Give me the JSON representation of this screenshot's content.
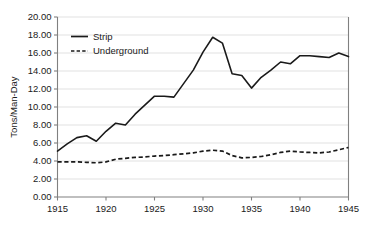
{
  "chart_data": {
    "type": "line",
    "title": "",
    "xlabel": "",
    "ylabel": "Tons/Man-Day",
    "xlim": [
      1915,
      1945
    ],
    "ylim": [
      0.0,
      20.0
    ],
    "grid": true,
    "legend_position": "top-left",
    "x": [
      1915,
      1916,
      1917,
      1918,
      1919,
      1920,
      1921,
      1922,
      1923,
      1924,
      1925,
      1926,
      1927,
      1928,
      1929,
      1930,
      1931,
      1932,
      1933,
      1934,
      1935,
      1936,
      1937,
      1938,
      1939,
      1940,
      1941,
      1942,
      1943,
      1944,
      1945
    ],
    "x_tick_labels": [
      "1915",
      "1920",
      "1925",
      "1930",
      "1935",
      "1940",
      "1945"
    ],
    "x_ticks": [
      1915,
      1920,
      1925,
      1930,
      1935,
      1940,
      1945
    ],
    "y_ticks": [
      0.0,
      2.0,
      4.0,
      6.0,
      8.0,
      10.0,
      12.0,
      14.0,
      16.0,
      18.0,
      20.0
    ],
    "y_tick_labels": [
      "0.00",
      "2.00",
      "4.00",
      "6.00",
      "8.00",
      "10.00",
      "12.00",
      "14.00",
      "16.00",
      "18.00",
      "20.00"
    ],
    "series": [
      {
        "name": "Strip",
        "style": "solid",
        "color": "#1a1a1a",
        "values": [
          5.1,
          5.9,
          6.6,
          6.8,
          6.2,
          7.3,
          8.2,
          8.0,
          9.2,
          10.2,
          11.2,
          11.2,
          11.1,
          12.6,
          14.1,
          16.1,
          17.75,
          17.1,
          13.7,
          13.5,
          12.1,
          13.3,
          14.1,
          15.0,
          14.8,
          15.7,
          15.7,
          15.6,
          15.5,
          16.0,
          15.6
        ]
      },
      {
        "name": "Underground",
        "style": "dashed",
        "color": "#1a1a1a",
        "values": [
          3.9,
          3.9,
          3.9,
          3.85,
          3.8,
          3.9,
          4.2,
          4.3,
          4.4,
          4.45,
          4.55,
          4.6,
          4.7,
          4.8,
          4.9,
          5.1,
          5.2,
          5.1,
          4.6,
          4.35,
          4.4,
          4.5,
          4.7,
          4.95,
          5.1,
          5.0,
          4.95,
          4.9,
          5.0,
          5.25,
          5.5
        ]
      }
    ],
    "legend": [
      {
        "label": "Strip",
        "style": "solid"
      },
      {
        "label": "Underground",
        "style": "dashed"
      }
    ],
    "colors": {
      "gridline": "#d9d9d9",
      "axis": "#808080",
      "text": "#1a1a1a",
      "background": "#ffffff"
    }
  }
}
